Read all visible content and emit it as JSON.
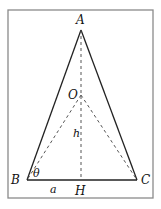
{
  "diagram": {
    "type": "geometry",
    "frame": {
      "x": 8,
      "y": 10,
      "width": 145,
      "height": 188,
      "stroke": "#8a8a8a"
    },
    "points": {
      "A": {
        "x": 81,
        "y": 30,
        "label": "A"
      },
      "B": {
        "x": 27,
        "y": 180,
        "label": "B"
      },
      "C": {
        "x": 137,
        "y": 180,
        "label": "C"
      },
      "O": {
        "x": 81,
        "y": 95,
        "label": "O"
      },
      "H": {
        "x": 81,
        "y": 180,
        "label": "H"
      }
    },
    "solid_segments": [
      "AB",
      "AC",
      "BC"
    ],
    "dashed_segments": [
      "AH",
      "OB",
      "OC"
    ],
    "annotations": {
      "h": "h",
      "a": "a",
      "theta": "θ"
    },
    "colors": {
      "line": "#222222",
      "dashed": "#555555",
      "frame": "#8a8a8a",
      "text": "#111111"
    }
  }
}
